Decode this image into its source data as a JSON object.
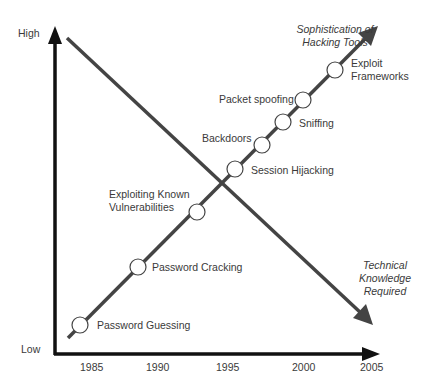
{
  "diagram": {
    "y_axis": {
      "high_label": "High",
      "low_label": "Low"
    },
    "x_axis": {
      "ticks": [
        "1985",
        "1990",
        "1995",
        "2000",
        "2005"
      ]
    },
    "rising_line_label": {
      "line1": "Sophistication of",
      "line2": "Hacking Tools"
    },
    "falling_line_label": {
      "line1": "Technical",
      "line2": "Knowledge",
      "line3": "Required"
    },
    "milestones": [
      {
        "label": "Password Guessing"
      },
      {
        "label": "Password Cracking"
      },
      {
        "label": "Exploiting Known",
        "label2": "Vulnerabilities"
      },
      {
        "label": "Session Hijacking"
      },
      {
        "label": "Backdoors"
      },
      {
        "label": "Sniffing"
      },
      {
        "label": "Packet spoofing"
      },
      {
        "label": "Exploit",
        "label2": "Frameworks"
      }
    ],
    "colors": {
      "axis": "#111111",
      "line": "#444444",
      "circle_fill": "#ffffff",
      "circle_stroke": "#444444",
      "text": "#3a3a3a"
    }
  }
}
